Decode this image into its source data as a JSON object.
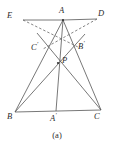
{
  "figure": {
    "caption": "(a)",
    "caption_position": {
      "x": 0,
      "y": 130
    },
    "canvas": {
      "width": 114,
      "height": 149
    },
    "style": {
      "stroke_color": "#555555",
      "dashed_stroke_color": "#666666",
      "label_color": "#2b2b2b",
      "background_color": "#ffffff",
      "stroke_width": 0.8,
      "dash_pattern": "2.5,2"
    },
    "points": [
      {
        "id": "E",
        "label": "E",
        "prime": false,
        "x": 23,
        "y": 20,
        "label_x": 7,
        "label_y": 11
      },
      {
        "id": "A",
        "label": "A",
        "prime": false,
        "x": 63,
        "y": 20,
        "label_x": 59,
        "label_y": 7
      },
      {
        "id": "D",
        "label": "D",
        "prime": false,
        "x": 97,
        "y": 19,
        "label_x": 98,
        "label_y": 10
      },
      {
        "id": "Cp",
        "label": "C",
        "prime": true,
        "x": 46,
        "y": 51,
        "label_x": 31,
        "label_y": 42
      },
      {
        "id": "Bp",
        "label": "B",
        "prime": true,
        "x": 75,
        "y": 49,
        "label_x": 78,
        "label_y": 41
      },
      {
        "id": "P",
        "label": "P",
        "prime": false,
        "x": 58,
        "y": 63,
        "label_x": 62,
        "label_y": 57
      },
      {
        "id": "B",
        "label": "B",
        "prime": false,
        "x": 15,
        "y": 112,
        "label_x": 7,
        "label_y": 113
      },
      {
        "id": "Ap",
        "label": "A",
        "prime": true,
        "x": 56,
        "y": 111,
        "label_x": 50,
        "label_y": 113
      },
      {
        "id": "C",
        "label": "C",
        "prime": false,
        "x": 101,
        "y": 110,
        "label_x": 94,
        "label_y": 113
      }
    ],
    "segments": [
      {
        "name": "segment-E-A",
        "from": "E",
        "to": "A",
        "dashed": false
      },
      {
        "name": "segment-A-D",
        "from": "A",
        "to": "D",
        "dashed": false
      },
      {
        "name": "segment-A-B",
        "from": "A",
        "to": "B",
        "dashed": false
      },
      {
        "name": "segment-A-C",
        "from": "A",
        "to": "C",
        "dashed": false
      },
      {
        "name": "segment-B-C",
        "from": "B",
        "to": "C",
        "dashed": false
      },
      {
        "name": "cevian-A-Aprime",
        "from": "A",
        "to": "Ap",
        "dashed": false
      },
      {
        "name": "cevian-B-Bprime",
        "from": "B",
        "to": "Bp",
        "dashed": false
      },
      {
        "name": "cevian-C-Cprime",
        "from": "C",
        "to": "Cp",
        "dashed": false
      },
      {
        "name": "dashed-E-Bprime",
        "from": "E",
        "to": "Bp",
        "dashed": true
      },
      {
        "name": "dashed-D-Cprime",
        "from": "D",
        "to": "Cp",
        "dashed": true
      }
    ],
    "extended_segments": [
      {
        "name": "cevian-B-Bprime-extended",
        "from": "B",
        "to": "A",
        "through": "Bp"
      },
      {
        "name": "cevian-C-Cprime-extended",
        "from": "C",
        "to": "A",
        "through": "Cp"
      }
    ],
    "dot_markers": [
      {
        "name": "vertex-dot-A",
        "x": 63,
        "y": 20
      },
      {
        "name": "vertex-dot-P",
        "x": 58,
        "y": 63
      }
    ]
  }
}
